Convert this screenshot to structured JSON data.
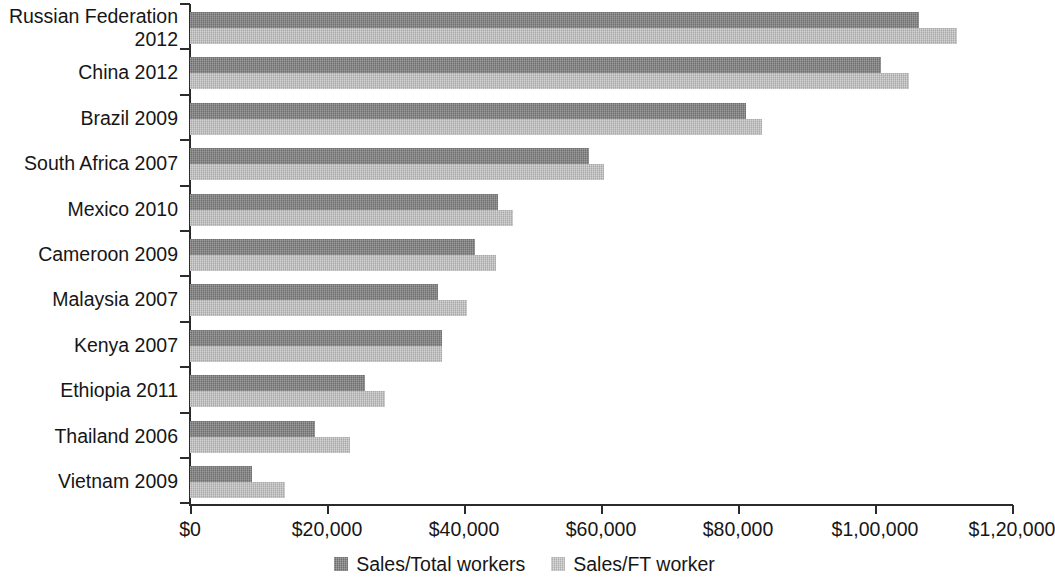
{
  "chart_data": {
    "type": "bar",
    "orientation": "horizontal",
    "title": "",
    "subtitle": "",
    "xlabel": "",
    "ylabel": "",
    "xlim": [
      0,
      120000
    ],
    "grid": false,
    "legend_position": "bottom-center",
    "categories": [
      "Russian Federation\n2012",
      "China 2012",
      "Brazil 2009",
      "South Africa 2007",
      "Mexico 2010",
      "Cameroon 2009",
      "Malaysia 2007",
      "Kenya 2007",
      "Ethiopia 2011",
      "Thailand 2006",
      "Vietnam 2009"
    ],
    "xticks": [
      0,
      20000,
      40000,
      60000,
      80000,
      100000,
      120000
    ],
    "xtick_labels": [
      "$0",
      "$20,000",
      "$40,000",
      "$60,000",
      "$80,000",
      "$1,00,000",
      "$1,20,000"
    ],
    "series": [
      {
        "name": "Sales/Total workers",
        "color": "#878787",
        "values": [
          106400,
          100900,
          81200,
          58200,
          45000,
          41600,
          36200,
          36800,
          25500,
          18200,
          9100
        ]
      },
      {
        "name": "Sales/FT worker",
        "color": "#c6c6c6",
        "values": [
          111900,
          105000,
          83500,
          60400,
          47200,
          44700,
          40400,
          36800,
          28500,
          23400,
          13900
        ]
      }
    ]
  },
  "legend": {
    "items": [
      {
        "label": "Sales/Total workers",
        "swatch": "total"
      },
      {
        "label": "Sales/FT worker",
        "swatch": "ft"
      }
    ]
  },
  "colors": {
    "series_total": "#878787",
    "series_ft": "#c6c6c6",
    "axis": "#2b2b2b",
    "text": "#161616",
    "background": "#ffffff"
  }
}
